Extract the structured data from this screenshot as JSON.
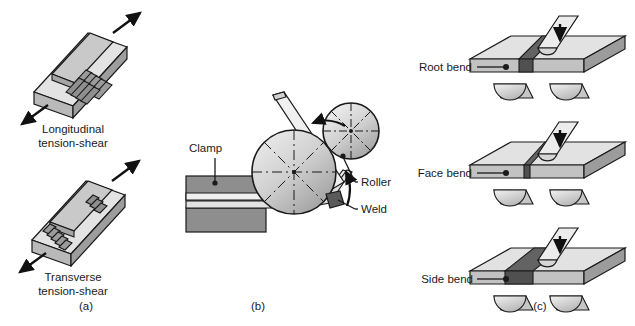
{
  "figure": {
    "panels": [
      {
        "id": "a",
        "caption": "(a)",
        "caption_x": 86,
        "caption_y": 310,
        "specimens": [
          {
            "name": "longitudinal-tension-shear",
            "label_line1": "Longitudinal",
            "label_line2": "tension-shear",
            "label_x": 73,
            "label_y1": 133,
            "label_y2": 147
          },
          {
            "name": "transverse-tension-shear",
            "label_line1": "Transverse",
            "label_line2": "tension-shear",
            "label_x": 73,
            "label_y1": 281,
            "label_y2": 295
          }
        ]
      },
      {
        "id": "b",
        "caption": "(b)",
        "caption_x": 258,
        "caption_y": 310,
        "labels": [
          {
            "name": "clamp",
            "text": "Clamp",
            "x": 189,
            "y": 152,
            "anchor": "start"
          },
          {
            "name": "roller",
            "text": "Roller",
            "x": 361,
            "y": 186,
            "anchor": "start"
          },
          {
            "name": "weld",
            "text": "Weld",
            "x": 361,
            "y": 213,
            "anchor": "start"
          }
        ]
      },
      {
        "id": "c",
        "caption": "(c)",
        "caption_x": 540,
        "caption_y": 310,
        "tests": [
          {
            "name": "root-bend",
            "label": "Root bend",
            "label_x": 415,
            "label_y": 71
          },
          {
            "name": "face-bend",
            "label": "Face bend",
            "label_x": 415,
            "label_y": 177
          },
          {
            "name": "side-bend",
            "label": "Side bend",
            "label_x": 416,
            "label_y": 283
          }
        ]
      }
    ],
    "colors": {
      "outline": "#1a1a1a",
      "plate_top": "#e0e0e0",
      "plate_face": "#bdbdbd",
      "plate_side": "#9a9a9a",
      "weld_dark": "#636363",
      "weld_darker": "#4f4f4f",
      "roller_light": "#d4d4d4",
      "roller_mid": "#b5b5b5",
      "roller_shadow": "#8f8f8f",
      "clamp_gray": "#8e8e8e",
      "strip_light": "#efefef",
      "background": "#ffffff",
      "arrow_black": "#111111"
    }
  }
}
